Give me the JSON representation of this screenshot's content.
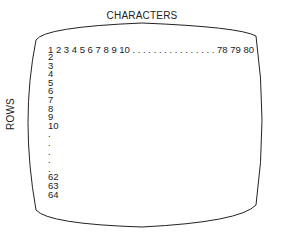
{
  "diagram": {
    "top_label": "CHARACTERS",
    "side_label": "ROWS",
    "first_row": "1 2 3 4 5 6 7 8 9 10 . . . . . . . . . . . . . . . . 78 79 80",
    "rows": [
      "2",
      "3",
      "4",
      "5",
      "6",
      "7",
      "8",
      "9",
      "10",
      ".",
      ".",
      ".",
      ".",
      ".",
      "62",
      "63",
      "64"
    ],
    "columns_total": "80",
    "rows_total": "64"
  }
}
